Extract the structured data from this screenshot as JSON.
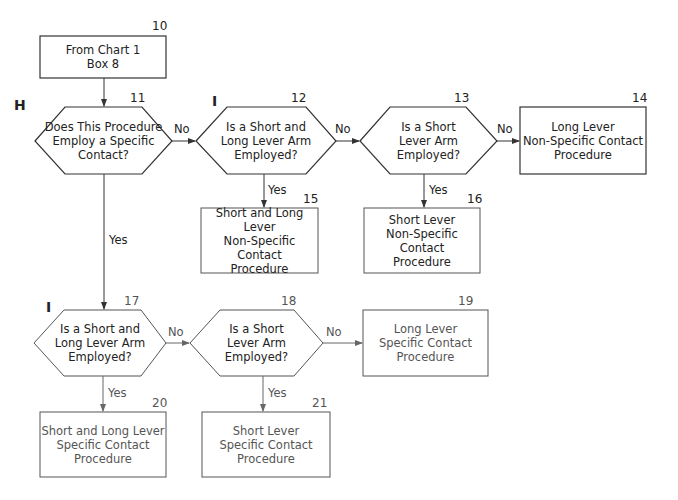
{
  "nodes": {
    "n10": {
      "number": "10",
      "text": "From Chart 1\nBox 8",
      "shape": "box"
    },
    "n11": {
      "number": "11",
      "text": "Does This Procedure\nEmploy a Specific\nContact?",
      "shape": "hexagon",
      "section": "H"
    },
    "n12": {
      "number": "12",
      "text": "Is a Short and\nLong Lever Arm\nEmployed?",
      "shape": "hexagon",
      "section": "I"
    },
    "n13": {
      "number": "13",
      "text": "Is a Short\nLever Arm\nEmployed?",
      "shape": "hexagon"
    },
    "n14": {
      "number": "14",
      "text": "Long Lever\nNon-Specific Contact\nProcedure",
      "shape": "box"
    },
    "n15": {
      "number": "15",
      "text": "Short and Long Lever\nNon-Specific Contact\nProcedure",
      "shape": "box"
    },
    "n16": {
      "number": "16",
      "text": "Short Lever\nNon-Specific Contact\nProcedure",
      "shape": "box"
    },
    "n17": {
      "number": "17",
      "text": "Is a Short and\nLong Lever Arm\nEmployed?",
      "shape": "hexagon",
      "section": "I"
    },
    "n18": {
      "number": "18",
      "text": "Is a Short\nLever Arm\nEmployed?",
      "shape": "hexagon"
    },
    "n19": {
      "number": "19",
      "text": "Long Lever\nSpecific Contact\nProcedure",
      "shape": "box"
    },
    "n20": {
      "number": "20",
      "text": "Short and Long Lever\nSpecific Contact\nProcedure",
      "shape": "box"
    },
    "n21": {
      "number": "21",
      "text": "Short Lever\nSpecific Contact\nProcedure",
      "shape": "box"
    }
  },
  "edges": [
    {
      "from": "10",
      "to": "11",
      "label": ""
    },
    {
      "from": "11",
      "to": "12",
      "label": "No"
    },
    {
      "from": "12",
      "to": "13",
      "label": "No"
    },
    {
      "from": "13",
      "to": "14",
      "label": "No"
    },
    {
      "from": "12",
      "to": "15",
      "label": "Yes"
    },
    {
      "from": "13",
      "to": "16",
      "label": "Yes"
    },
    {
      "from": "11",
      "to": "17",
      "label": "Yes"
    },
    {
      "from": "17",
      "to": "18",
      "label": "No"
    },
    {
      "from": "18",
      "to": "19",
      "label": "No"
    },
    {
      "from": "17",
      "to": "20",
      "label": "Yes"
    },
    {
      "from": "18",
      "to": "21",
      "label": "Yes"
    }
  ],
  "labels": {
    "no": "No",
    "yes": "Yes"
  }
}
